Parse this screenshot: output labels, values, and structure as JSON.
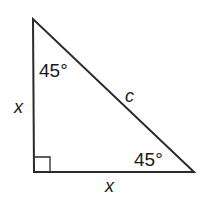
{
  "diagram": {
    "type": "right-triangle",
    "colors": {
      "stroke": "#2a2a2a",
      "text": "#1a1a1a",
      "background": "#ffffff"
    },
    "vertices": {
      "top": [
        33,
        19
      ],
      "right_angle": [
        34,
        172
      ],
      "bottom_right": [
        194,
        172
      ]
    },
    "angles": {
      "top": "45°",
      "bottom_right": "45°",
      "right_angle_marker": true
    },
    "sides": {
      "vertical_leg": "x",
      "horizontal_leg": "x",
      "hypotenuse": "c"
    }
  }
}
